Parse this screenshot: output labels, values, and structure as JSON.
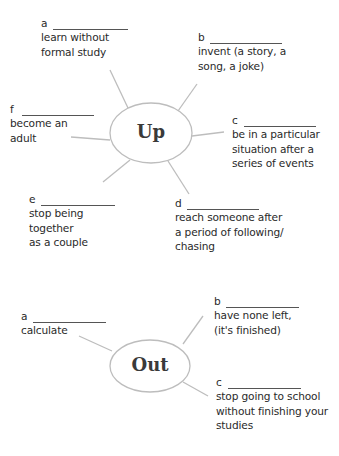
{
  "up": {
    "center_label": "Up",
    "items": [
      {
        "letter": "a",
        "definition": "learn without\nformal study"
      },
      {
        "letter": "b",
        "definition": "invent (a story, a\nsong, a joke)"
      },
      {
        "letter": "c",
        "definition": "be in a particular\nsituation after a\nseries of events"
      },
      {
        "letter": "d",
        "definition": "reach someone after\na period of following/\nchasing"
      },
      {
        "letter": "e",
        "definition": "stop being\ntogether\nas a couple"
      },
      {
        "letter": "f",
        "definition": "become an\nadult"
      }
    ]
  },
  "out": {
    "center_label": "Out",
    "items": [
      {
        "letter": "a",
        "definition": "calculate"
      },
      {
        "letter": "b",
        "definition": "have none left,\n(it's finished)"
      },
      {
        "letter": "c",
        "definition": "stop going to school\nwithout finishing your\nstudies"
      }
    ]
  },
  "colors": {
    "lines": "#bdbdbd",
    "text": "#2a2a2a"
  }
}
